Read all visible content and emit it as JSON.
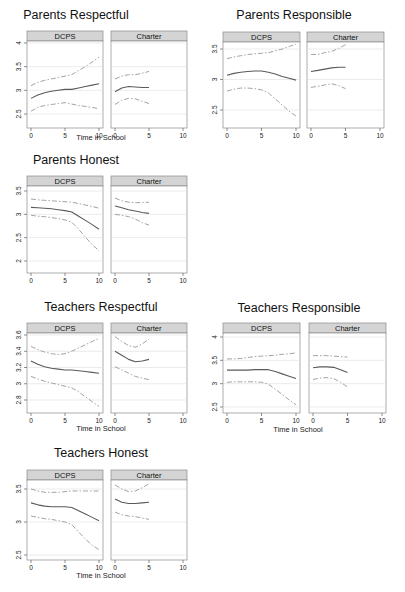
{
  "chart_data": [
    {
      "type": "line",
      "title": "Parents Respectful",
      "xlabel": "Time in School",
      "ylabel": "",
      "xlim": [
        0,
        10
      ],
      "ylim": [
        2.5,
        4
      ],
      "yticks": [
        "2.5",
        "3",
        "3.5",
        "4"
      ],
      "xticks": [
        "0",
        "5",
        "10"
      ],
      "grid": true,
      "facets": [
        {
          "name": "DCPS",
          "x": [
            0,
            1,
            2,
            3,
            4,
            5,
            6,
            7,
            8,
            9,
            10
          ],
          "series": [
            {
              "name": "estimate",
              "style": "solid",
              "values": [
                2.83,
                2.9,
                2.95,
                2.98,
                3.0,
                3.02,
                3.02,
                3.05,
                3.08,
                3.11,
                3.14
              ]
            },
            {
              "name": "upper CI",
              "style": "dashed",
              "values": [
                3.1,
                3.17,
                3.21,
                3.24,
                3.27,
                3.3,
                3.33,
                3.42,
                3.5,
                3.6,
                3.7
              ]
            },
            {
              "name": "lower CI",
              "style": "dashed",
              "values": [
                2.56,
                2.64,
                2.68,
                2.7,
                2.72,
                2.74,
                2.71,
                2.68,
                2.66,
                2.64,
                2.61
              ]
            }
          ]
        },
        {
          "name": "Charter",
          "x": [
            0,
            1,
            2,
            3,
            4,
            5
          ],
          "series": [
            {
              "name": "estimate",
              "style": "solid",
              "values": [
                2.97,
                3.05,
                3.08,
                3.07,
                3.06,
                3.06
              ]
            },
            {
              "name": "upper CI",
              "style": "dashed",
              "values": [
                3.24,
                3.3,
                3.33,
                3.33,
                3.36,
                3.4
              ]
            },
            {
              "name": "lower CI",
              "style": "dashed",
              "values": [
                2.7,
                2.79,
                2.83,
                2.82,
                2.77,
                2.72
              ]
            }
          ]
        }
      ]
    },
    {
      "type": "line",
      "title": "Parents Responsible",
      "xlabel": "",
      "ylabel": "",
      "xlim": [
        0,
        10
      ],
      "ylim": [
        2.4,
        3.6
      ],
      "yticks": [
        "2.5",
        "3",
        "3.5"
      ],
      "xticks": [
        "0",
        "5",
        "10"
      ],
      "grid": true,
      "facets": [
        {
          "name": "DCPS",
          "x": [
            0,
            1,
            2,
            3,
            4,
            5,
            6,
            7,
            8,
            9,
            10
          ],
          "series": [
            {
              "name": "estimate",
              "style": "solid",
              "values": [
                3.07,
                3.1,
                3.12,
                3.13,
                3.14,
                3.14,
                3.12,
                3.09,
                3.05,
                3.02,
                2.99
              ]
            },
            {
              "name": "upper CI",
              "style": "dashed",
              "values": [
                3.34,
                3.37,
                3.39,
                3.41,
                3.42,
                3.43,
                3.44,
                3.47,
                3.5,
                3.54,
                3.58
              ]
            },
            {
              "name": "lower CI",
              "style": "dashed",
              "values": [
                2.81,
                2.84,
                2.86,
                2.86,
                2.85,
                2.83,
                2.78,
                2.68,
                2.58,
                2.48,
                2.4
              ]
            }
          ]
        },
        {
          "name": "Charter",
          "x": [
            0,
            1,
            2,
            3,
            4,
            5
          ],
          "series": [
            {
              "name": "estimate",
              "style": "solid",
              "values": [
                3.13,
                3.15,
                3.17,
                3.19,
                3.2,
                3.2
              ]
            },
            {
              "name": "upper CI",
              "style": "dashed",
              "values": [
                3.41,
                3.41,
                3.44,
                3.46,
                3.51,
                3.57
              ]
            },
            {
              "name": "lower CI",
              "style": "dashed",
              "values": [
                2.87,
                2.89,
                2.91,
                2.93,
                2.9,
                2.85
              ]
            }
          ]
        }
      ]
    },
    {
      "type": "line",
      "title": "Parents Honest",
      "xlabel": "Time in School",
      "ylabel": "",
      "xlim": [
        0,
        10
      ],
      "ylim": [
        2,
        3.6
      ],
      "yticks": [
        "2",
        "2.5",
        "3",
        "3.5"
      ],
      "xticks": [
        "0",
        "5",
        "10"
      ],
      "grid": true,
      "facets": [
        {
          "name": "DCPS",
          "x": [
            0,
            1,
            2,
            3,
            4,
            5,
            6,
            7,
            8,
            9,
            10
          ],
          "series": [
            {
              "name": "estimate",
              "style": "solid",
              "values": [
                3.15,
                3.14,
                3.13,
                3.12,
                3.1,
                3.08,
                3.05,
                2.96,
                2.87,
                2.78,
                2.68
              ]
            },
            {
              "name": "upper CI",
              "style": "dashed",
              "values": [
                3.33,
                3.31,
                3.3,
                3.29,
                3.28,
                3.27,
                3.26,
                3.23,
                3.2,
                3.17,
                3.13
              ]
            },
            {
              "name": "lower CI",
              "style": "dashed",
              "values": [
                2.98,
                2.96,
                2.95,
                2.93,
                2.91,
                2.88,
                2.83,
                2.68,
                2.51,
                2.35,
                2.22
              ]
            }
          ]
        },
        {
          "name": "Charter",
          "x": [
            0,
            1,
            2,
            3,
            4,
            5
          ],
          "series": [
            {
              "name": "estimate",
              "style": "solid",
              "values": [
                3.18,
                3.14,
                3.1,
                3.07,
                3.04,
                3.02
              ]
            },
            {
              "name": "upper CI",
              "style": "dashed",
              "values": [
                3.35,
                3.29,
                3.26,
                3.25,
                3.25,
                3.26
              ]
            },
            {
              "name": "lower CI",
              "style": "dashed",
              "values": [
                3.0,
                2.98,
                2.95,
                2.9,
                2.82,
                2.77
              ]
            }
          ]
        }
      ]
    },
    {
      "type": "line",
      "title": "Teachers Respectful",
      "xlabel": "Time in School",
      "ylabel": "",
      "xlim": [
        0,
        10
      ],
      "ylim": [
        2.7,
        3.65
      ],
      "yticks": [
        "2.8",
        "3",
        "3.2",
        "3.4",
        "3.6"
      ],
      "xticks": [
        "0",
        "5",
        "10"
      ],
      "grid": true,
      "facets": [
        {
          "name": "DCPS",
          "x": [
            0,
            1,
            2,
            3,
            4,
            5,
            6,
            7,
            8,
            9,
            10
          ],
          "series": [
            {
              "name": "estimate",
              "style": "solid",
              "values": [
                3.28,
                3.24,
                3.21,
                3.19,
                3.18,
                3.17,
                3.17,
                3.16,
                3.15,
                3.14,
                3.13
              ]
            },
            {
              "name": "upper CI",
              "style": "dashed",
              "values": [
                3.46,
                3.42,
                3.39,
                3.37,
                3.36,
                3.37,
                3.4,
                3.44,
                3.48,
                3.52,
                3.56
              ]
            },
            {
              "name": "lower CI",
              "style": "dashed",
              "values": [
                3.09,
                3.06,
                3.03,
                3.01,
                2.99,
                2.97,
                2.95,
                2.9,
                2.84,
                2.78,
                2.72
              ]
            }
          ]
        },
        {
          "name": "Charter",
          "x": [
            0,
            1,
            2,
            3,
            4,
            5
          ],
          "series": [
            {
              "name": "estimate",
              "style": "solid",
              "values": [
                3.4,
                3.35,
                3.3,
                3.27,
                3.28,
                3.3
              ]
            },
            {
              "name": "upper CI",
              "style": "dashed",
              "values": [
                3.58,
                3.52,
                3.47,
                3.45,
                3.49,
                3.55
              ]
            },
            {
              "name": "lower CI",
              "style": "dashed",
              "values": [
                3.21,
                3.17,
                3.13,
                3.09,
                3.07,
                3.05
              ]
            }
          ]
        }
      ]
    },
    {
      "type": "line",
      "title": "Teachers Responsible",
      "xlabel": "Time in School",
      "ylabel": "",
      "xlim": [
        0,
        10
      ],
      "ylim": [
        2.4,
        4.1
      ],
      "yticks": [
        "2.5",
        "3",
        "3.5",
        "4"
      ],
      "xticks": [
        "0",
        "5",
        "10"
      ],
      "grid": true,
      "facets": [
        {
          "name": "DCPS",
          "x": [
            0,
            1,
            2,
            3,
            4,
            5,
            6,
            7,
            8,
            9,
            10
          ],
          "series": [
            {
              "name": "estimate",
              "style": "solid",
              "values": [
                3.29,
                3.29,
                3.29,
                3.29,
                3.3,
                3.3,
                3.3,
                3.26,
                3.21,
                3.16,
                3.11
              ]
            },
            {
              "name": "upper CI",
              "style": "dashed",
              "values": [
                3.53,
                3.53,
                3.54,
                3.56,
                3.58,
                3.59,
                3.6,
                3.61,
                3.63,
                3.64,
                3.66
              ]
            },
            {
              "name": "lower CI",
              "style": "dashed",
              "values": [
                3.03,
                3.04,
                3.04,
                3.04,
                3.04,
                3.03,
                2.99,
                2.88,
                2.77,
                2.65,
                2.55
              ]
            }
          ]
        },
        {
          "name": "Charter",
          "x": [
            0,
            1,
            2,
            3,
            4,
            5
          ],
          "series": [
            {
              "name": "estimate",
              "style": "solid",
              "values": [
                3.34,
                3.36,
                3.36,
                3.35,
                3.3,
                3.24
              ]
            },
            {
              "name": "upper CI",
              "style": "dashed",
              "values": [
                3.6,
                3.6,
                3.6,
                3.59,
                3.58,
                3.57
              ]
            },
            {
              "name": "lower CI",
              "style": "dashed",
              "values": [
                3.09,
                3.12,
                3.13,
                3.11,
                3.03,
                2.93
              ]
            }
          ]
        }
      ]
    },
    {
      "type": "line",
      "title": "Teachers Honest",
      "xlabel": "Time in School",
      "ylabel": "",
      "xlim": [
        0,
        10
      ],
      "ylim": [
        2.45,
        3.6
      ],
      "yticks": [
        "2.5",
        "3",
        "3.5"
      ],
      "xticks": [
        "0",
        "5",
        "10"
      ],
      "grid": true,
      "facets": [
        {
          "name": "DCPS",
          "x": [
            0,
            1,
            2,
            3,
            4,
            5,
            6,
            7,
            8,
            9,
            10
          ],
          "series": [
            {
              "name": "estimate",
              "style": "solid",
              "values": [
                3.29,
                3.26,
                3.24,
                3.23,
                3.23,
                3.23,
                3.22,
                3.17,
                3.12,
                3.07,
                3.02
              ]
            },
            {
              "name": "upper CI",
              "style": "dashed",
              "values": [
                3.5,
                3.47,
                3.45,
                3.45,
                3.45,
                3.46,
                3.47,
                3.47,
                3.47,
                3.47,
                3.47
              ]
            },
            {
              "name": "lower CI",
              "style": "dashed",
              "values": [
                3.09,
                3.07,
                3.05,
                3.04,
                3.02,
                3.0,
                2.96,
                2.85,
                2.74,
                2.65,
                2.58
              ]
            }
          ]
        },
        {
          "name": "Charter",
          "x": [
            0,
            1,
            2,
            3,
            4,
            5
          ],
          "series": [
            {
              "name": "estimate",
              "style": "solid",
              "values": [
                3.35,
                3.3,
                3.28,
                3.28,
                3.29,
                3.3
              ]
            },
            {
              "name": "upper CI",
              "style": "dashed",
              "values": [
                3.56,
                3.5,
                3.46,
                3.47,
                3.52,
                3.58
              ]
            },
            {
              "name": "lower CI",
              "style": "dashed",
              "values": [
                3.15,
                3.11,
                3.09,
                3.08,
                3.06,
                3.04
              ]
            }
          ]
        }
      ]
    }
  ],
  "layout": {
    "panels": [
      {
        "x": 76,
        "y": 0,
        "dcps_left": 27,
        "charter_left": 111,
        "facet_w": 76,
        "strip_top": 31,
        "strip_h": 10,
        "plot_bottom": 128,
        "ymap": [
          [
            2.5,
            114
          ],
          [
            4,
            43
          ]
        ],
        "show_xlabel": true,
        "xlabel_y": 140
      },
      {
        "x": 294,
        "y": 0,
        "dcps_left": 223,
        "charter_left": 307,
        "facet_w": 77,
        "strip_top": 32,
        "strip_h": 10,
        "plot_bottom": 128,
        "ymap": [
          [
            2.5,
            110
          ],
          [
            3.5,
            49
          ]
        ],
        "show_xlabel": false,
        "xlabel_y": 0
      },
      {
        "x": 76,
        "y": 0,
        "dcps_left": 27,
        "charter_left": 111,
        "facet_w": 76,
        "strip_top": 176,
        "strip_h": 10,
        "plot_bottom": 273,
        "ymap": [
          [
            2,
            261
          ],
          [
            3.5,
            191
          ]
        ],
        "show_xlabel": false,
        "xlabel_y": 0
      },
      {
        "x": 101,
        "y": 0,
        "dcps_left": 27,
        "charter_left": 111,
        "facet_w": 76,
        "strip_top": 323,
        "strip_h": 10,
        "plot_bottom": 413,
        "ymap": [
          [
            2.8,
            400
          ],
          [
            3.6,
            335
          ]
        ],
        "show_xlabel": true,
        "xlabel_y": 431
      },
      {
        "x": 299,
        "y": 0,
        "dcps_left": 223,
        "charter_left": 309,
        "facet_w": 77,
        "strip_top": 323,
        "strip_h": 10,
        "plot_bottom": 413,
        "ymap": [
          [
            2.5,
            407
          ],
          [
            4,
            337
          ]
        ],
        "show_xlabel": true,
        "xlabel_y": 432
      },
      {
        "x": 101,
        "y": 0,
        "dcps_left": 27,
        "charter_left": 111,
        "facet_w": 76,
        "strip_top": 470,
        "strip_h": 10,
        "plot_bottom": 560,
        "ymap": [
          [
            2.5,
            555
          ],
          [
            3.5,
            489
          ]
        ],
        "show_xlabel": true,
        "xlabel_y": 578
      }
    ],
    "title_y": [
      19,
      19,
      164,
      311,
      312,
      457
    ],
    "title_x": [
      76,
      294,
      76,
      101,
      299,
      101
    ],
    "xlabel_x": [
      101,
      0,
      0,
      101,
      298,
      101
    ],
    "colors": {
      "strip_bg": "#d4d4d4",
      "strip_border": "#8a8a8a",
      "frame": "#8a8a8a",
      "grid": "#e6e6e6",
      "estimate": "#5a5a5a",
      "ci": "#a3a3a3"
    }
  }
}
